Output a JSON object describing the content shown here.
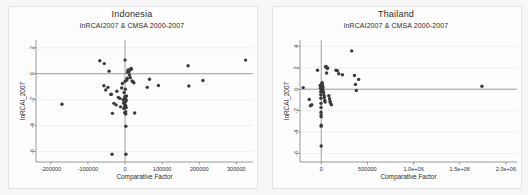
{
  "figure": {
    "background_color": "#f7f7f7",
    "panel_background_color": "#fdfdfd",
    "point_color": "#3b3b3b",
    "axis_color": "#6f6f6f",
    "grid_color": "#e8e8e8"
  },
  "chart_data": [
    {
      "type": "scatter",
      "title": "Indonesia",
      "subtitle": "lnRCAI2007 & CMSA 2000-2007",
      "xlabel": "Comparative Factor",
      "ylabel": "lnRCAI_2007",
      "grid": true,
      "legend": "none",
      "xlim": [
        -240000,
        345000
      ],
      "ylim": [
        -6.8,
        2.6
      ],
      "xticks": [
        -200000,
        -100000,
        0,
        100000,
        200000,
        300000
      ],
      "xticklabels": [
        "-200000",
        "-100000",
        "0",
        "100000",
        "200000",
        "300000"
      ],
      "yticks": [
        2,
        0,
        -2,
        -4,
        -6
      ],
      "yticklabels": [
        "2",
        "0",
        "-2",
        "-4",
        "-6"
      ],
      "reference_lines": {
        "horizontal": 0,
        "vertical": 0
      },
      "points": [
        [
          -170000,
          -2.35
        ],
        [
          -68000,
          1.0
        ],
        [
          -56000,
          0.78
        ],
        [
          -57000,
          -0.92
        ],
        [
          -52000,
          -1.25
        ],
        [
          -46000,
          -1.05
        ],
        [
          -43000,
          0.2
        ],
        [
          -38000,
          -1.6
        ],
        [
          -37000,
          -1.58
        ],
        [
          -34000,
          -3.05
        ],
        [
          -35000,
          -6.2
        ],
        [
          -30000,
          -2.28
        ],
        [
          -24000,
          -2.4
        ],
        [
          -22000,
          -1.35
        ],
        [
          -18000,
          -1.82
        ],
        [
          -14000,
          -1.9
        ],
        [
          -12000,
          -2.55
        ],
        [
          -9000,
          -1.1
        ],
        [
          -7000,
          -0.75
        ],
        [
          -5000,
          -2.0
        ],
        [
          -4000,
          -2.25
        ],
        [
          -3000,
          -2.68
        ],
        [
          -2500,
          -1.45
        ],
        [
          -2000,
          -1.95
        ],
        [
          -1500,
          -2.3
        ],
        [
          -1000,
          -3.0
        ],
        [
          -800,
          -2.52
        ],
        [
          -500,
          -1.75
        ],
        [
          0,
          1.05
        ],
        [
          500,
          -0.58
        ],
        [
          800,
          -1.2
        ],
        [
          1000,
          -1.88
        ],
        [
          1200,
          -2.15
        ],
        [
          1500,
          -2.45
        ],
        [
          1800,
          -2.92
        ],
        [
          2000,
          -3.1
        ],
        [
          2200,
          -4.05
        ],
        [
          2500,
          -6.2
        ],
        [
          3000,
          -2.6
        ],
        [
          3500,
          -2.05
        ],
        [
          4000,
          -1.72
        ],
        [
          5000,
          -0.48
        ],
        [
          6000,
          -0.35
        ],
        [
          7000,
          0.12
        ],
        [
          8000,
          0.25
        ],
        [
          9000,
          0.3
        ],
        [
          11000,
          0.18
        ],
        [
          12000,
          -0.1
        ],
        [
          14000,
          -0.3
        ],
        [
          16000,
          0.4
        ],
        [
          17000,
          0.35
        ],
        [
          19000,
          -0.55
        ],
        [
          21000,
          -0.62
        ],
        [
          24000,
          -0.7
        ],
        [
          26000,
          -3.02
        ],
        [
          60000,
          -1.05
        ],
        [
          66000,
          -0.42
        ],
        [
          90000,
          -0.9
        ],
        [
          170000,
          0.62
        ],
        [
          172000,
          -0.95
        ],
        [
          210000,
          -0.52
        ],
        [
          325000,
          1.05
        ]
      ]
    },
    {
      "type": "scatter",
      "title": "Thailand",
      "subtitle": "lnRCAI2007 & CMSA 2000-2007",
      "xlabel": "Comparative Factor",
      "ylabel": "lnRCAI_2007",
      "grid": true,
      "legend": "none",
      "xlim": [
        -230000,
        2120000
      ],
      "ylim": [
        -6.8,
        4.6
      ],
      "xticks": [
        0,
        500000,
        1000000,
        1500000,
        2000000
      ],
      "xticklabels": [
        "0",
        "500000",
        "1.0e+06",
        "1.5e+06",
        "2.0e+06"
      ],
      "yticks": [
        4,
        2,
        0,
        -2,
        -4,
        -6
      ],
      "yticklabels": [
        "4",
        "2",
        "0",
        "-2",
        "-4",
        "-6"
      ],
      "reference_lines": {
        "horizontal": 0,
        "vertical": 0
      },
      "points": [
        [
          -195000,
          0.15
        ],
        [
          -130000,
          -0.95
        ],
        [
          -118000,
          -1.55
        ],
        [
          -102000,
          -1.45
        ],
        [
          -40000,
          1.78
        ],
        [
          -12000,
          0.35
        ],
        [
          -8000,
          0.1
        ],
        [
          -6000,
          -0.22
        ],
        [
          -5000,
          -0.52
        ],
        [
          -4000,
          -0.85
        ],
        [
          -3000,
          -1.32
        ],
        [
          -2500,
          -1.7
        ],
        [
          -2000,
          -2.15
        ],
        [
          -1500,
          -2.4
        ],
        [
          -1200,
          -2.58
        ],
        [
          -1000,
          -3.35
        ],
        [
          -800,
          -3.45
        ],
        [
          -600,
          -5.3
        ],
        [
          0,
          0.42
        ],
        [
          2000,
          0.22
        ],
        [
          4000,
          0.05
        ],
        [
          6000,
          -0.1
        ],
        [
          9000,
          0.62
        ],
        [
          12000,
          0.48
        ],
        [
          15000,
          0.3
        ],
        [
          18000,
          0.18
        ],
        [
          20000,
          -0.05
        ],
        [
          25000,
          -0.3
        ],
        [
          30000,
          -0.58
        ],
        [
          34000,
          -0.78
        ],
        [
          38000,
          -1.05
        ],
        [
          42000,
          -1.2
        ],
        [
          48000,
          2.1
        ],
        [
          52000,
          2.12
        ],
        [
          58000,
          1.52
        ],
        [
          64000,
          1.95
        ],
        [
          70000,
          1.98
        ],
        [
          82000,
          -0.6
        ],
        [
          90000,
          -0.88
        ],
        [
          95000,
          -1.12
        ],
        [
          100000,
          -1.28
        ],
        [
          110000,
          -1.45
        ],
        [
          160000,
          1.78
        ],
        [
          175000,
          1.72
        ],
        [
          190000,
          1.45
        ],
        [
          230000,
          1.35
        ],
        [
          330000,
          3.58
        ],
        [
          360000,
          1.28
        ],
        [
          370000,
          0.45
        ],
        [
          380000,
          -0.12
        ],
        [
          405000,
          0.92
        ],
        [
          1740000,
          0.28
        ]
      ]
    }
  ]
}
